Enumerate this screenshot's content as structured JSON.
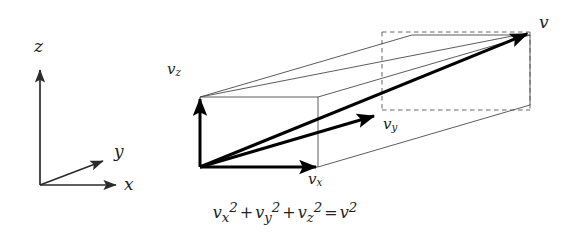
{
  "figure": {
    "caption_equation": "v_x^2 + v_y^2 + v_z^2 = v^2",
    "axes": {
      "z_label": "z",
      "y_label": "y",
      "x_label": "x"
    },
    "vectors": {
      "vz_label_base": "v",
      "vz_label_sub": "z",
      "vx_label_base": "v",
      "vx_label_sub": "x",
      "vy_label_base": "v",
      "vy_label_sub": "y",
      "v_label": "v"
    },
    "equation_parts": {
      "t1_base": "v",
      "t1_sub": "x",
      "t1_sup": "2",
      "plus1": "+",
      "t2_base": "v",
      "t2_sub": "y",
      "t2_sup": "2",
      "plus2": "+",
      "t3_base": "v",
      "t3_sub": "z",
      "t3_sup": "2",
      "equals": "=",
      "t4_base": "v",
      "t4_sup": "2"
    },
    "colors": {
      "background": "#ffffff",
      "stroke_thin": "#4a4a4a",
      "stroke_thick": "#000000",
      "stroke_dashed": "#555555",
      "text": "#222222"
    }
  }
}
